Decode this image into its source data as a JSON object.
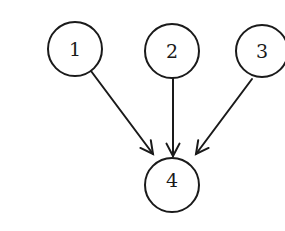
{
  "diagram": {
    "type": "directed-graph",
    "background": "#ffffff",
    "stroke_color": "#1a1a1a",
    "nodes": [
      {
        "id": "1",
        "label": "1",
        "cx": 75,
        "cy": 49,
        "r": 27
      },
      {
        "id": "2",
        "label": "2",
        "cx": 172,
        "cy": 51,
        "r": 27
      },
      {
        "id": "3",
        "label": "3",
        "cx": 262,
        "cy": 51,
        "r": 26
      },
      {
        "id": "4",
        "label": "4",
        "cx": 172,
        "cy": 185,
        "r": 27
      }
    ],
    "edges": [
      {
        "from": "1",
        "to": "4",
        "x1": 91,
        "y1": 71,
        "x2": 153,
        "y2": 154
      },
      {
        "from": "2",
        "to": "4",
        "x1": 173,
        "y1": 78,
        "x2": 173,
        "y2": 156
      },
      {
        "from": "3",
        "to": "4",
        "x1": 252,
        "y1": 79,
        "x2": 196,
        "y2": 154
      }
    ]
  }
}
